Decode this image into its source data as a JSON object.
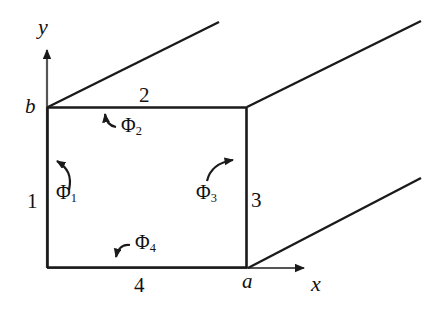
{
  "figure": {
    "kind": "geometry-diagram",
    "background_color": "#ffffff",
    "stroke_color": "#1a1a1a"
  },
  "axes": {
    "x_label": "x",
    "y_label": "y",
    "origin_label": "",
    "x_axis": {
      "x1": 47,
      "y1": 268,
      "x2": 312,
      "y2": 268,
      "arrow": true
    },
    "y_axis": {
      "x1": 47,
      "y1": 268,
      "x2": 47,
      "y2": 42,
      "arrow": true
    }
  },
  "points": {
    "a_label": "a",
    "b_label": "b",
    "a_pos": {
      "x": 243,
      "y": 272
    },
    "b_pos": {
      "x": 26,
      "y": 96
    }
  },
  "rectangle": {
    "left": 47,
    "top": 107,
    "right": 247,
    "bottom": 268
  },
  "walls": [
    {
      "id": "wall-1",
      "label": "1",
      "side": "left",
      "x": 28,
      "y": 190
    },
    {
      "id": "wall-2",
      "label": "2",
      "side": "top",
      "x": 139,
      "y": 84
    },
    {
      "id": "wall-3",
      "label": "3",
      "side": "right",
      "x": 252,
      "y": 189
    },
    {
      "id": "wall-4",
      "label": "4",
      "side": "bottom",
      "x": 133,
      "y": 274
    }
  ],
  "flux_arrows": [
    {
      "id": "phi-1",
      "symbol": "Φ",
      "subscript": "1",
      "label_x": 55,
      "label_y": 182,
      "direction": "up-left",
      "wall": "1"
    },
    {
      "id": "phi-2",
      "symbol": "Φ",
      "subscript": "2",
      "label_x": 110,
      "label_y": 115,
      "direction": "up",
      "wall": "2"
    },
    {
      "id": "phi-3",
      "symbol": "Φ",
      "subscript": "3",
      "label_x": 195,
      "label_y": 182,
      "direction": "up-right",
      "wall": "3"
    },
    {
      "id": "phi-4",
      "symbol": "Φ",
      "subscript": "4",
      "label_x": 128,
      "label_y": 238,
      "direction": "down",
      "wall": "4"
    }
  ],
  "perspective_lines": [
    {
      "id": "persp-top-left",
      "x1": 48,
      "y1": 107,
      "x2": 219,
      "y2": 22
    },
    {
      "id": "persp-top-right",
      "x1": 247,
      "y1": 107,
      "x2": 420,
      "y2": 21
    },
    {
      "id": "persp-bottom",
      "x1": 248,
      "y1": 268,
      "x2": 420,
      "y2": 178
    }
  ]
}
